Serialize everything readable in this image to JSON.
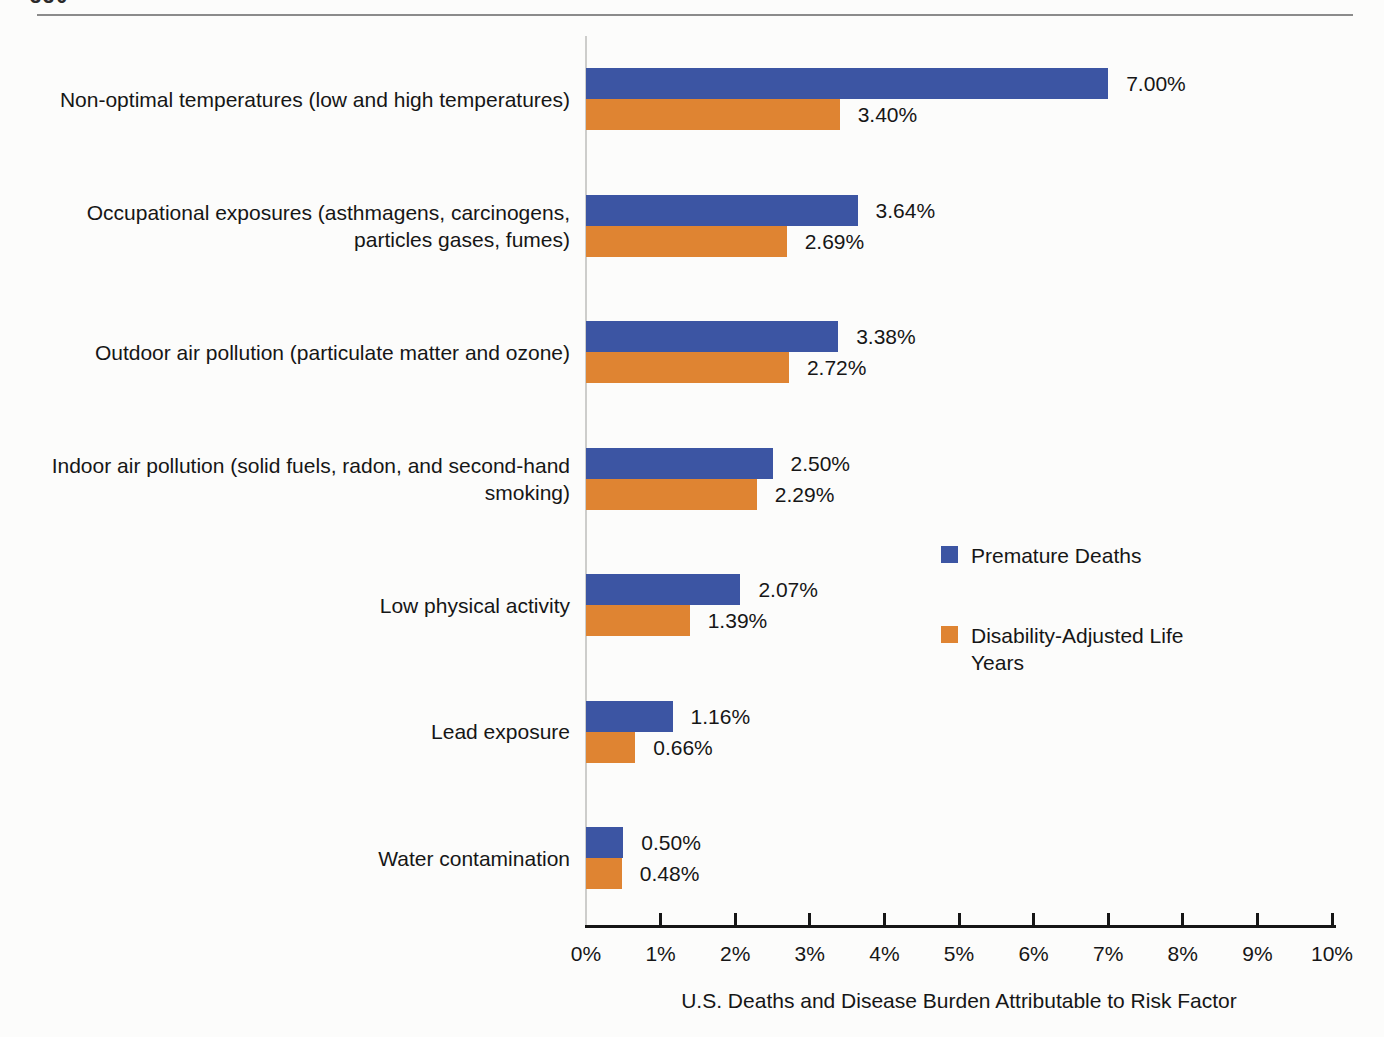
{
  "page": {
    "page_number_partial": "330"
  },
  "colors": {
    "premature_deaths": "#3c55a3",
    "dalys": "#df8432",
    "axis": "#161616",
    "plot_left_line": "#cdcdcb",
    "top_rule": "#8b8b8b",
    "text": "#161616"
  },
  "chart_data": {
    "type": "bar",
    "orientation": "horizontal",
    "title": "",
    "xlabel": "U.S. Deaths and Disease Burden Attributable to Risk Factor",
    "ylabel": "",
    "xlim": [
      0,
      10
    ],
    "grid": false,
    "legend_position": "middle-right",
    "x_ticks": [
      "0%",
      "1%",
      "2%",
      "3%",
      "4%",
      "5%",
      "6%",
      "7%",
      "8%",
      "9%",
      "10%"
    ],
    "categories": [
      {
        "lines": [
          "Non-optimal temperatures (low and high temperatures)"
        ]
      },
      {
        "lines": [
          "Occupational exposures (asthmagens, carcinogens,",
          "particles gases, fumes)"
        ]
      },
      {
        "lines": [
          "Outdoor air pollution (particulate matter and ozone)"
        ]
      },
      {
        "lines": [
          "Indoor air pollution (solid fuels, radon, and second-hand",
          "smoking)"
        ]
      },
      {
        "lines": [
          "Low physical activity"
        ]
      },
      {
        "lines": [
          "Lead exposure"
        ]
      },
      {
        "lines": [
          "Water contamination"
        ]
      }
    ],
    "series": [
      {
        "key": "premature-deaths",
        "name": "Premature Deaths",
        "legend_lines": [
          "Premature Deaths"
        ],
        "color": "#3c55a3",
        "values": [
          7.0,
          3.64,
          3.38,
          2.5,
          2.07,
          1.16,
          0.5
        ],
        "labels": [
          "7.00%",
          "3.64%",
          "3.38%",
          "2.50%",
          "2.07%",
          "1.16%",
          "0.50%"
        ]
      },
      {
        "key": "disability-adjusted-life-years",
        "name": "Disability-Adjusted Life Years",
        "legend_lines": [
          "Disability-Adjusted Life",
          "Years"
        ],
        "color": "#df8432",
        "values": [
          3.4,
          2.69,
          2.72,
          2.29,
          1.39,
          0.66,
          0.48
        ],
        "labels": [
          "3.40%",
          "2.69%",
          "2.72%",
          "2.29%",
          "1.39%",
          "0.66%",
          "0.48%"
        ]
      }
    ]
  }
}
